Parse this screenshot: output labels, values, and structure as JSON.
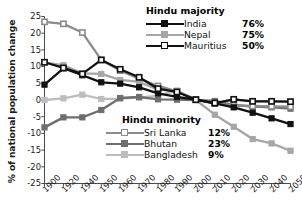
{
  "chart_data": {
    "type": "line",
    "title": "",
    "xlabel": "",
    "ylabel": "% of national population change",
    "ylim": [
      -25,
      25
    ],
    "yticks": [
      25,
      20,
      15,
      10,
      5,
      0,
      -5,
      -10,
      -15,
      -20,
      -25
    ],
    "ytick_labels": [
      "25",
      "20",
      "15",
      "10",
      "5",
      "0",
      "-5",
      "-10",
      "-15",
      "-20",
      "-25"
    ],
    "categories": [
      "1900",
      "1920",
      "1940",
      "1950",
      "1960",
      "1970",
      "1980",
      "1990",
      "2000",
      "2010",
      "2020",
      "2030",
      "2040",
      "2050"
    ],
    "grid": false,
    "legend_position": "inside",
    "series": [
      {
        "name": "India",
        "group": "Hindu majority",
        "value_label": "76%",
        "color": "#111111",
        "marker": "filled-square",
        "values": [
          4.6,
          9.5,
          7.4,
          5.3,
          4.9,
          3.8,
          2.0,
          0.9,
          0.1,
          -1.0,
          -2.2,
          -3.8,
          -5.5,
          -7.2
        ]
      },
      {
        "name": "Nepal",
        "group": "Hindu majority",
        "value_label": "75%",
        "color": "#a6a6a6",
        "marker": "filled-square",
        "values": [
          11.2,
          10.4,
          8.0,
          7.8,
          6.0,
          5.4,
          3.1,
          2.7,
          0.0,
          -4.4,
          -8.0,
          -11.7,
          -13.0,
          -15.2
        ]
      },
      {
        "name": "Mauritius",
        "group": "Hindu majority",
        "value_label": "50%",
        "color": "#111111",
        "marker": "open-square",
        "values": [
          11.3,
          9.6,
          7.8,
          12.0,
          9.2,
          6.8,
          3.4,
          2.4,
          0.1,
          -0.9,
          0.2,
          -0.4,
          -0.4,
          -0.5
        ]
      },
      {
        "name": "Sri Lanka",
        "group": "Hindu minority",
        "value_label": "12%",
        "color": "#8c8c8c",
        "marker": "open-square",
        "values": [
          23.4,
          22.8,
          20.2,
          12.0,
          8.8,
          6.4,
          4.2,
          2.6,
          0.1,
          -1.0,
          -1.6,
          -1.8,
          -1.9,
          -2.0
        ]
      },
      {
        "name": "Bhutan",
        "group": "Hindu minority",
        "value_label": "23%",
        "color": "#6e6e6e",
        "marker": "filled-square",
        "values": [
          -8.2,
          -5.2,
          -5.2,
          -3.0,
          0.6,
          0.9,
          0.2,
          0.1,
          0.0,
          -0.3,
          -1.5,
          -2.0,
          -2.2,
          -2.6
        ]
      },
      {
        "name": "Bangladesh",
        "group": "Hindu minority",
        "value_label": "9%",
        "color": "#bdbdbd",
        "marker": "filled-square",
        "values": [
          0.0,
          0.5,
          1.6,
          0.3,
          0.4,
          0.7,
          1.3,
          2.8,
          0.0,
          -1.0,
          0.1,
          -0.3,
          -0.4,
          -0.5
        ]
      }
    ]
  },
  "legends": {
    "majority": {
      "title": "Hindu majority",
      "rows": [
        {
          "name": "India",
          "value": "76%"
        },
        {
          "name": "Nepal",
          "value": "75%"
        },
        {
          "name": "Mauritius",
          "value": "50%"
        }
      ]
    },
    "minority": {
      "title": "Hindu minority",
      "rows": [
        {
          "name": "Sri Lanka",
          "value": "12%"
        },
        {
          "name": "Bhutan",
          "value": "23%"
        },
        {
          "name": "Bangladesh",
          "value": "9%"
        }
      ]
    }
  }
}
